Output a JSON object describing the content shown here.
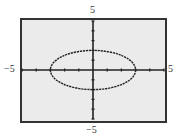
{
  "chart_data": {
    "type": "line",
    "title": "",
    "equation": "x^2/9 + y^2/4 = 1",
    "series": [
      {
        "name": "ellipse",
        "center": [
          0,
          0
        ],
        "semi_axis_x": 3,
        "semi_axis_y": 2
      }
    ],
    "xlim": [
      -5,
      5
    ],
    "ylim": [
      -5,
      5
    ],
    "xscale": 1,
    "yscale": 1,
    "grid": false,
    "tick_labels": {
      "x_min": "−5",
      "x_max": "5",
      "y_min": "−5",
      "y_max": "5"
    },
    "xlabel": "",
    "ylabel": ""
  },
  "colors": {
    "screen_bg": "#ebebeb",
    "frame": "#333333",
    "curve": "#222222",
    "axes": "#222222"
  }
}
